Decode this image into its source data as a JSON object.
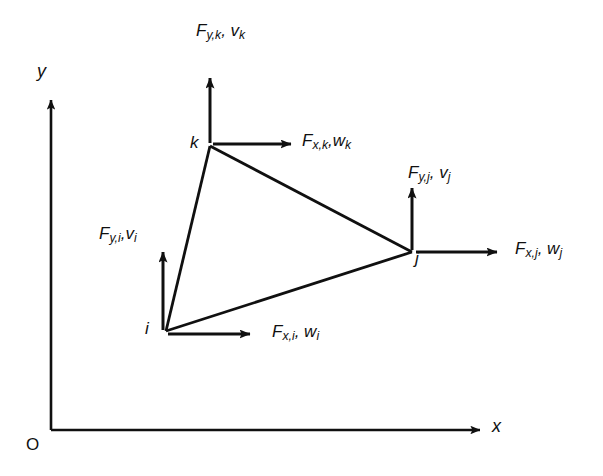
{
  "figure": {
    "background_color": "#ffffff",
    "ink_color": "#101010"
  },
  "axes": {
    "x_label": "x",
    "y_label": "y",
    "origin_label": "O"
  },
  "nodes": [
    {
      "id": "i",
      "label": "i",
      "x": 166,
      "y": 331
    },
    {
      "id": "j",
      "label": "j",
      "x": 412,
      "y": 252
    },
    {
      "id": "k",
      "label": "k",
      "x": 210,
      "y": 146
    }
  ],
  "arrows": [
    {
      "id": "i-horizontal",
      "node": "i",
      "direction": "right",
      "force_symbol": "F",
      "force_subscript": "x,i",
      "displacement_symbol": "w",
      "displacement_subscript": "i",
      "label_text": "F x,i , w i"
    },
    {
      "id": "i-vertical",
      "node": "i",
      "direction": "up",
      "force_symbol": "F",
      "force_subscript": "y,i",
      "displacement_symbol": "v",
      "displacement_subscript": "i",
      "label_text": "F y,i , v i"
    },
    {
      "id": "j-horizontal",
      "node": "j",
      "direction": "right",
      "force_symbol": "F",
      "force_subscript": "x,j",
      "displacement_symbol": "w",
      "displacement_subscript": "j",
      "label_text": "F x,j , w j"
    },
    {
      "id": "j-vertical",
      "node": "j",
      "direction": "up",
      "force_symbol": "F",
      "force_subscript": "y,j",
      "displacement_symbol": "v",
      "displacement_subscript": "j",
      "label_text": "F y,j , v j"
    },
    {
      "id": "k-horizontal",
      "node": "k",
      "direction": "right",
      "force_symbol": "F",
      "force_subscript": "x,k",
      "displacement_symbol": "w",
      "displacement_subscript": "k",
      "label_text": "F x,k , w k"
    },
    {
      "id": "k-vertical",
      "node": "k",
      "direction": "up",
      "force_symbol": "F",
      "force_subscript": "y,k",
      "displacement_symbol": "v",
      "displacement_subscript": "k",
      "label_text": "F y,k , v k"
    }
  ]
}
